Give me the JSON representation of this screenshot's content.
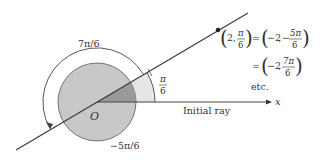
{
  "diagram": {
    "type": "polar-coordinates-illustration",
    "origin_label": "O",
    "axis_label": "x",
    "initial_ray_label": "Initial ray",
    "angle_labels": {
      "positive_small": {
        "num": "π",
        "den": "6"
      },
      "positive_large": "7π/6",
      "negative": "−5π/6"
    },
    "equation": {
      "line1_left": {
        "r": "2",
        "theta_num": "π",
        "theta_den": "6"
      },
      "line1_right": {
        "r": "−2",
        "theta_sign": "−",
        "theta_num": "5π",
        "theta_den": "6"
      },
      "line2_right": {
        "r": "−2",
        "theta_num": "7π",
        "theta_den": "6"
      },
      "equals": "=",
      "comma": ",",
      "etc": "etc."
    },
    "colors": {
      "disk_fill": "#c8c8c8",
      "small_sector_fill": "#e6e6e6",
      "dark_wedge_fill": "#9a9a9a",
      "stroke": "#3a3a3a",
      "text": "#333333",
      "background": "#ffffff"
    }
  }
}
